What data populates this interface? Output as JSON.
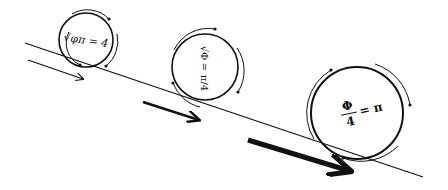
{
  "diagram": {
    "colors": {
      "stroke": "#111111",
      "background": "#ffffff"
    },
    "incline": {
      "x1": 25,
      "y1": 43,
      "x2": 423,
      "y2": 177
    },
    "circles": [
      {
        "id": "small",
        "cx": 86,
        "cy": 40,
        "r": 27,
        "formula": "√φπ = 4",
        "rotation": -8,
        "font_size": 11
      },
      {
        "id": "medium",
        "cx": 205,
        "cy": 67,
        "r": 33,
        "formula_parts": [
          "√Φ",
          "=",
          "π/4"
        ],
        "rotation": 90,
        "font_size": 10
      },
      {
        "id": "large",
        "cx": 357,
        "cy": 113,
        "r": 46,
        "formula_num": "Φ",
        "formula_den": "4",
        "formula_rhs": "= π",
        "rotation": -12,
        "font_size": 12
      }
    ],
    "arrows": [
      {
        "id": "small-arrow",
        "x1": 28,
        "y1": 60,
        "x2": 83,
        "y2": 79,
        "width": 1.2
      },
      {
        "id": "medium-arrow",
        "x1": 143,
        "y1": 102,
        "x2": 200,
        "y2": 120,
        "width": 2.5
      },
      {
        "id": "large-arrow",
        "x1": 248,
        "y1": 140,
        "x2": 352,
        "y2": 172,
        "width": 5
      }
    ]
  }
}
